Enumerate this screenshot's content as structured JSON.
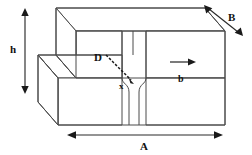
{
  "figure": {
    "kind": "engineering-line-diagram",
    "background_color": "#ffffff",
    "line_color": "#4a4a4a",
    "label_color": "#111111",
    "labels": {
      "height": "h",
      "depth": "B",
      "diagonal": "D",
      "throat": "x",
      "channel_width": "b",
      "length": "A"
    },
    "dimensions": [
      {
        "name": "h",
        "orientation": "vertical",
        "arrow": "double",
        "label": "h"
      },
      {
        "name": "B",
        "orientation": "diagonal",
        "arrow": "double",
        "label": "B"
      },
      {
        "name": "A",
        "orientation": "horizontal",
        "arrow": "double",
        "label": "A"
      },
      {
        "name": "b",
        "orientation": "horizontal",
        "arrow": "single-right",
        "label": "b"
      }
    ],
    "annotations": [
      {
        "name": "D",
        "label": "D",
        "leader": "dashed",
        "points_to": "x"
      },
      {
        "name": "x",
        "label": "x",
        "leader": "none",
        "points_to": "throat"
      }
    ]
  }
}
